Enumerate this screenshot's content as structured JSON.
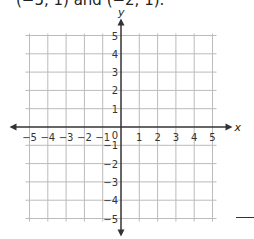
{
  "caption": "(−5, 1) and (−2, 1).",
  "graph": {
    "x_axis_label": "x",
    "y_axis_label": "y",
    "x_ticks": [
      "−5",
      "−4",
      "−3",
      "−2",
      "−1",
      "1",
      "2",
      "3",
      "4",
      "5"
    ],
    "y_ticks": [
      "5",
      "4",
      "3",
      "2",
      "1",
      "−1",
      "−2",
      "−3",
      "−4",
      "−5"
    ],
    "origin_label": "0",
    "range": {
      "xmin": -5,
      "xmax": 5,
      "ymin": -5,
      "ymax": 5
    },
    "grid_color": "#bbbbbb",
    "axis_color": "#333333"
  }
}
